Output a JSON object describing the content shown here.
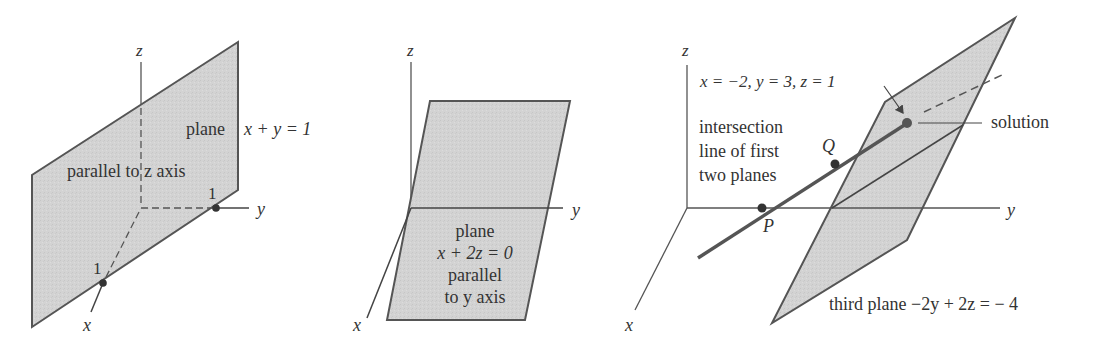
{
  "colors": {
    "plane_fill": "#d3d3d3",
    "outline": "#555555",
    "axis": "#555555",
    "text": "#333333",
    "point": "#333333"
  },
  "figure1": {
    "axes": {
      "x": "x",
      "y": "y",
      "z": "z"
    },
    "tick_x": "1",
    "tick_y": "1",
    "plane_label": "plane",
    "equation": "x + y = 1",
    "description": "parallel to z axis"
  },
  "figure2": {
    "axes": {
      "x": "x",
      "y": "y",
      "z": "z"
    },
    "plane_label": "plane",
    "equation": "x + 2z = 0",
    "description_line1": "parallel",
    "description_line2": "to y axis"
  },
  "figure3": {
    "axes": {
      "x": "x",
      "y": "y",
      "z": "z"
    },
    "solution_coords": "x = −2, y = 3, z = 1",
    "solution_label": "solution",
    "intersection_line1": "intersection",
    "intersection_line2": "line of first",
    "intersection_line3": "two planes",
    "point_p": "P",
    "point_q": "Q",
    "third_plane_label": "third plane −2y + 2z = − 4"
  }
}
